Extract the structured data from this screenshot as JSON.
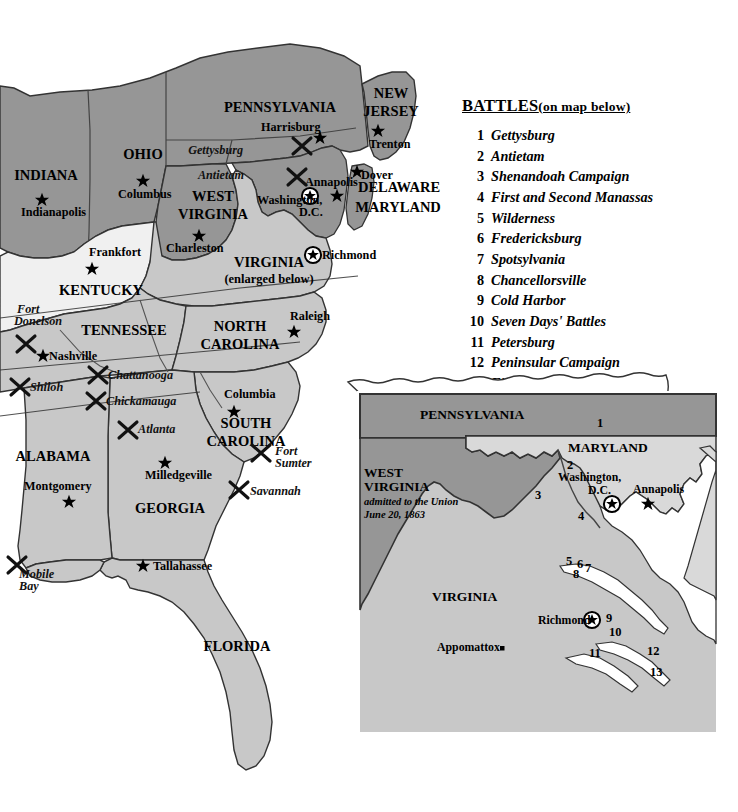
{
  "legend": {
    "title_main": "BATTLES",
    "title_note": "(on map below)",
    "battles": [
      {
        "num": "1",
        "name": "Gettysburg"
      },
      {
        "num": "2",
        "name": "Antietam"
      },
      {
        "num": "3",
        "name": "Shenandoah Campaign"
      },
      {
        "num": "4",
        "name": "First and Second Manassas"
      },
      {
        "num": "5",
        "name": "Wilderness"
      },
      {
        "num": "6",
        "name": "Fredericksburg"
      },
      {
        "num": "7",
        "name": "Spotsylvania"
      },
      {
        "num": "8",
        "name": "Chancellorsville"
      },
      {
        "num": "9",
        "name": "Cold Harbor"
      },
      {
        "num": "10",
        "name": "Seven Days' Battles"
      },
      {
        "num": "11",
        "name": "Petersburg"
      },
      {
        "num": "12",
        "name": "Peninsular Campaign"
      },
      {
        "num": "13",
        "name": "First and Second",
        "name2": "Hampton Roads"
      }
    ]
  },
  "colors": {
    "union": "#969696",
    "confederate": "#c8c8c8",
    "border_state": "#f0f0f0",
    "water": "#ffffff",
    "outline": "#333333",
    "text": "#000000"
  },
  "main_map": {
    "states": [
      {
        "name": "INDIANA",
        "side": "union",
        "x": 46,
        "y": 180
      },
      {
        "name": "OHIO",
        "side": "union",
        "x": 143,
        "y": 159
      },
      {
        "name": "WEST",
        "side": "union",
        "x": 213,
        "y": 201
      },
      {
        "name": "VIRGINIA",
        "side": "union",
        "x": 213,
        "y": 219
      },
      {
        "name": "PENNSYLVANIA",
        "side": "union",
        "x": 280,
        "y": 112
      },
      {
        "name": "NEW",
        "side": "union",
        "x": 391,
        "y": 98
      },
      {
        "name": "JERSEY",
        "side": "union",
        "x": 391,
        "y": 116
      },
      {
        "name": "DELAWARE",
        "side": "union",
        "x": 399,
        "y": 192
      },
      {
        "name": "MARYLAND",
        "side": "union",
        "x": 398,
        "y": 212
      },
      {
        "name": "KENTUCKY",
        "side": "border_state",
        "x": 101,
        "y": 295
      },
      {
        "name": "VIRGINIA",
        "side": "confederate",
        "x": 269,
        "y": 267
      },
      {
        "name": "TENNESSEE",
        "side": "confederate",
        "x": 124,
        "y": 335
      },
      {
        "name": "NORTH",
        "side": "confederate",
        "x": 240,
        "y": 331
      },
      {
        "name": "CAROLINA",
        "side": "confederate",
        "x": 240,
        "y": 349
      },
      {
        "name": "SOUTH",
        "side": "confederate",
        "x": 246,
        "y": 428
      },
      {
        "name": "CAROLINA",
        "side": "confederate",
        "x": 246,
        "y": 446
      },
      {
        "name": "ALABAMA",
        "side": "confederate",
        "x": 53,
        "y": 461
      },
      {
        "name": "GEORGIA",
        "side": "confederate",
        "x": 170,
        "y": 513
      },
      {
        "name": "FLORIDA",
        "side": "confederate",
        "x": 237,
        "y": 651
      }
    ],
    "virginia_subnote": "(enlarged below)",
    "cities": [
      {
        "name": "Indianapolis",
        "x": 21,
        "y": 216,
        "sx": 42,
        "sy": 200,
        "cap": false,
        "anchor": "start"
      },
      {
        "name": "Columbus",
        "x": 118,
        "y": 198,
        "sx": 143,
        "sy": 181,
        "cap": false,
        "anchor": "start"
      },
      {
        "name": "Charleston",
        "x": 166,
        "y": 252,
        "sx": 199,
        "sy": 236,
        "cap": false,
        "anchor": "start"
      },
      {
        "name": "Frankfort",
        "x": 89,
        "y": 256,
        "sx": 92,
        "sy": 269,
        "cap": false,
        "anchor": "start"
      },
      {
        "name": "Nashville",
        "x": 49,
        "y": 360,
        "sx": 43,
        "sy": 356,
        "cap": false,
        "anchor": "start"
      },
      {
        "name": "Harrisburg",
        "x": 261,
        "y": 131,
        "sx": 320,
        "sy": 138,
        "cap": false,
        "anchor": "start"
      },
      {
        "name": "Trenton",
        "x": 369,
        "y": 148,
        "sx": 378,
        "sy": 131,
        "cap": false,
        "anchor": "start"
      },
      {
        "name": "Dover",
        "x": 361,
        "y": 179,
        "sx": 357,
        "sy": 172,
        "cap": false,
        "anchor": "start"
      },
      {
        "name": "Annapolis",
        "x": 305,
        "y": 186,
        "sx": 337,
        "sy": 196,
        "cap": false,
        "anchor": "start"
      },
      {
        "name": "Washington,",
        "x": 257,
        "y": 204,
        "sx": 310,
        "sy": 196,
        "cap": true,
        "anchor": "start"
      },
      {
        "name": "D.C.",
        "x": 299,
        "y": 216,
        "sx": 0,
        "sy": 0,
        "cap": false,
        "anchor": "start"
      },
      {
        "name": "Richmond",
        "x": 322,
        "y": 259,
        "sx": 313,
        "sy": 255,
        "cap": true,
        "anchor": "start"
      },
      {
        "name": "Raleigh",
        "x": 290,
        "y": 320,
        "sx": 294,
        "sy": 332,
        "cap": false,
        "anchor": "start"
      },
      {
        "name": "Columbia",
        "x": 224,
        "y": 398,
        "sx": 234,
        "sy": 412,
        "cap": false,
        "anchor": "start"
      },
      {
        "name": "Milledgeville",
        "x": 145,
        "y": 479,
        "sx": 165,
        "sy": 463,
        "cap": false,
        "anchor": "start"
      },
      {
        "name": "Montgomery",
        "x": 24,
        "y": 490,
        "sx": 69,
        "sy": 502,
        "cap": false,
        "anchor": "start"
      },
      {
        "name": "Tallahassee",
        "x": 153,
        "y": 570,
        "sx": 143,
        "sy": 566,
        "cap": false,
        "anchor": "start"
      }
    ],
    "battle_markers": [
      {
        "name": "Gettysburg",
        "x": 243,
        "y": 154,
        "mx": 302,
        "my": 146,
        "anchor": "end"
      },
      {
        "name": "Antietam",
        "x": 244,
        "y": 179,
        "mx": 297,
        "my": 177,
        "anchor": "end"
      },
      {
        "name": "Fort",
        "x": 17,
        "y": 313,
        "mx": 26,
        "my": 344,
        "anchor": "start"
      },
      {
        "name": "Donelson",
        "x": 14,
        "y": 325,
        "mx": 0,
        "my": 0,
        "anchor": "start"
      },
      {
        "name": "Shiloh",
        "x": 30,
        "y": 391,
        "mx": 20,
        "my": 387,
        "anchor": "start"
      },
      {
        "name": "Chattanooga",
        "x": 108,
        "y": 379,
        "mx": 98,
        "my": 375,
        "anchor": "start"
      },
      {
        "name": "Chickamauga",
        "x": 106,
        "y": 405,
        "mx": 96,
        "my": 401,
        "anchor": "start"
      },
      {
        "name": "Atlanta",
        "x": 138,
        "y": 433,
        "mx": 128,
        "my": 430,
        "anchor": "start"
      },
      {
        "name": "Fort",
        "x": 275,
        "y": 455,
        "mx": 261,
        "my": 453,
        "anchor": "start"
      },
      {
        "name": "Sumter",
        "x": 275,
        "y": 467,
        "mx": 0,
        "my": 0,
        "anchor": "start"
      },
      {
        "name": "Savannah",
        "x": 250,
        "y": 495,
        "mx": 239,
        "my": 490,
        "anchor": "start"
      },
      {
        "name": "Mobile",
        "x": 19,
        "y": 578,
        "mx": 17,
        "my": 565,
        "anchor": "start"
      },
      {
        "name": "Bay",
        "x": 19,
        "y": 590,
        "mx": 0,
        "my": 0,
        "anchor": "start"
      }
    ]
  },
  "inset_map": {
    "states": [
      {
        "name": "PENNSYLVANIA",
        "x": 420,
        "y": 419,
        "side": "union"
      },
      {
        "name": "MARYLAND",
        "x": 568,
        "y": 452,
        "side": "union"
      },
      {
        "name": "WEST",
        "x": 364,
        "y": 477,
        "side": "union"
      },
      {
        "name": "VIRGINIA",
        "x": 364,
        "y": 491,
        "side": "union"
      },
      {
        "name": "VIRGINIA",
        "x": 432,
        "y": 601,
        "side": "confederate"
      }
    ],
    "wv_note_line1": "admitted to the Union",
    "wv_note_line2": "June 20, 1863",
    "cities": [
      {
        "name": "Washington,",
        "x": 558,
        "y": 481,
        "sx": 612,
        "sy": 504,
        "cap": true
      },
      {
        "name": "D.C.",
        "x": 588,
        "y": 494,
        "sx": 0,
        "sy": 0,
        "cap": false
      },
      {
        "name": "Annapolis",
        "x": 633,
        "y": 493,
        "sx": 648,
        "sy": 504,
        "cap": false
      },
      {
        "name": "Richmond",
        "x": 538,
        "y": 624,
        "sx": 592,
        "sy": 620,
        "cap": true
      },
      {
        "name": "Appomattox",
        "x": 437,
        "y": 651,
        "sx": 0,
        "sy": 0,
        "cap": false
      }
    ],
    "battle_numbers": [
      {
        "num": "1",
        "x": 597,
        "y": 427
      },
      {
        "num": "2",
        "x": 567,
        "y": 469
      },
      {
        "num": "3",
        "x": 535,
        "y": 499
      },
      {
        "num": "4",
        "x": 578,
        "y": 520
      },
      {
        "num": "5",
        "x": 566,
        "y": 565
      },
      {
        "num": "6",
        "x": 577,
        "y": 568
      },
      {
        "num": "7",
        "x": 585,
        "y": 572
      },
      {
        "num": "8",
        "x": 573,
        "y": 578
      },
      {
        "num": "9",
        "x": 606,
        "y": 622
      },
      {
        "num": "10",
        "x": 609,
        "y": 636
      },
      {
        "num": "11",
        "x": 589,
        "y": 657
      },
      {
        "num": "12",
        "x": 647,
        "y": 655
      },
      {
        "num": "13",
        "x": 650,
        "y": 676
      }
    ]
  }
}
